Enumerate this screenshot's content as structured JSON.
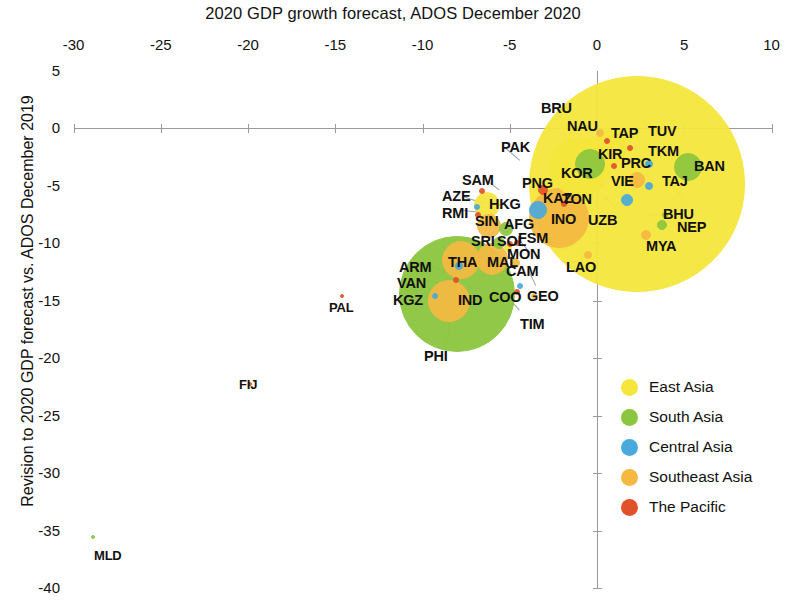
{
  "chart_data": {
    "type": "scatter",
    "title": "2020 GDP growth forecast, ADOS December 2020",
    "xlabel": "2020 GDP growth forecast, ADOS December 2020",
    "ylabel": "Revision to 2020 GDP forecast vs. ADOS December 2019",
    "xlim": [
      -32.5,
      11
    ],
    "ylim": [
      -41,
      6
    ],
    "xticks": [
      "-30",
      "-25",
      "-20",
      "-15",
      "-10",
      "-5",
      "0",
      "5",
      "10"
    ],
    "xtick_values": [
      -30,
      -25,
      -20,
      -15,
      -10,
      -5,
      0,
      5,
      10
    ],
    "yticks": [
      "5",
      "0",
      "-5",
      "-10",
      "-15",
      "-20",
      "-25",
      "-30",
      "-35",
      "-40"
    ],
    "ytick_values": [
      5,
      0,
      -5,
      -10,
      -15,
      -20,
      -25,
      -30,
      -35,
      -40
    ],
    "grid": false,
    "legend_position": "bottom-right",
    "legend": [
      {
        "label": "East Asia",
        "color": "#f5e63c"
      },
      {
        "label": "South Asia",
        "color": "#8cc63f"
      },
      {
        "label": "Central Asia",
        "color": "#4aa9dd"
      },
      {
        "label": "Southeast Asia",
        "color": "#f5b942"
      },
      {
        "label": "The Pacific",
        "color": "#e2522a"
      }
    ],
    "bubble_note": "bubble area scales with economy size",
    "points": [
      {
        "code": "PRC",
        "x": 2.3,
        "y": -4.9,
        "r": 108,
        "group": "East Asia"
      },
      {
        "code": "IND",
        "x": -8.0,
        "y": -14.4,
        "r": 58,
        "group": "South Asia"
      },
      {
        "code": "INO",
        "x": -2.2,
        "y": -7.8,
        "r": 30,
        "group": "Southeast Asia"
      },
      {
        "code": "KOR",
        "x": -1.0,
        "y": -3.4,
        "r": 30,
        "group": "East Asia"
      },
      {
        "code": "PAK",
        "x": -0.4,
        "y": -3.1,
        "r": 15,
        "group": "South Asia"
      },
      {
        "code": "PHI",
        "x": -8.5,
        "y": -15.0,
        "r": 21,
        "group": "Southeast Asia"
      },
      {
        "code": "BAN",
        "x": 5.2,
        "y": -3.4,
        "r": 14,
        "group": "South Asia"
      },
      {
        "code": "THA",
        "x": -7.8,
        "y": -11.5,
        "r": 19,
        "group": "Southeast Asia"
      },
      {
        "code": "MAL",
        "x": -6.0,
        "y": -11.4,
        "r": 16,
        "group": "Southeast Asia"
      },
      {
        "code": "HKG",
        "x": -6.3,
        "y": -6.7,
        "r": 13,
        "group": "East Asia"
      },
      {
        "code": "SIN",
        "x": -6.2,
        "y": -8.5,
        "r": 12,
        "group": "Southeast Asia"
      },
      {
        "code": "TAP",
        "x": 0.7,
        "y": -1.7,
        "r": 17,
        "group": "East Asia"
      },
      {
        "code": "VIE",
        "x": 2.3,
        "y": -4.5,
        "r": 8,
        "group": "Southeast Asia"
      },
      {
        "code": "KAZ",
        "x": -3.4,
        "y": -7.1,
        "r": 9,
        "group": "Central Asia"
      },
      {
        "code": "UZB",
        "x": 1.7,
        "y": -6.3,
        "r": 6,
        "group": "Central Asia"
      },
      {
        "code": "AFG",
        "x": -5.2,
        "y": -8.8,
        "r": 7,
        "group": "South Asia"
      },
      {
        "code": "SRI",
        "x": -5.6,
        "y": -10.0,
        "r": 6,
        "group": "South Asia"
      },
      {
        "code": "NEP",
        "x": 3.7,
        "y": -8.4,
        "r": 5,
        "group": "South Asia"
      },
      {
        "code": "MYA",
        "x": 2.8,
        "y": -9.3,
        "r": 5,
        "group": "Southeast Asia"
      },
      {
        "code": "CAM",
        "x": -4.7,
        "y": -11.7,
        "r": 5,
        "group": "Southeast Asia"
      },
      {
        "code": "MON",
        "x": -5.1,
        "y": -10.4,
        "r": 4,
        "group": "East Asia"
      },
      {
        "code": "LAO",
        "x": -0.5,
        "y": -11.0,
        "r": 4,
        "group": "Southeast Asia"
      },
      {
        "code": "PNG",
        "x": -3.1,
        "y": -5.4,
        "r": 5,
        "group": "The Pacific"
      },
      {
        "code": "KGZ",
        "x": -9.3,
        "y": -14.6,
        "r": 3,
        "group": "Central Asia"
      },
      {
        "code": "ARM",
        "x": -7.9,
        "y": -12.0,
        "r": 4,
        "group": "Central Asia"
      },
      {
        "code": "AZE",
        "x": -6.9,
        "y": -6.9,
        "r": 3,
        "group": "Central Asia"
      },
      {
        "code": "GEO",
        "x": -4.4,
        "y": -13.7,
        "r": 3,
        "group": "Central Asia"
      },
      {
        "code": "TAJ",
        "x": 3.0,
        "y": -5.0,
        "r": 4,
        "group": "Central Asia"
      },
      {
        "code": "TKM",
        "x": 3.0,
        "y": -3.1,
        "r": 4,
        "group": "Central Asia"
      },
      {
        "code": "BHU",
        "x": 3.9,
        "y": -7.6,
        "r": 3,
        "group": "South Asia"
      },
      {
        "code": "TIM",
        "x": -3.6,
        "y": -14.6,
        "r": 3,
        "group": "Southeast Asia"
      },
      {
        "code": "BRU",
        "x": 0.2,
        "y": -0.4,
        "r": 4,
        "group": "Southeast Asia"
      },
      {
        "code": "FSM",
        "x": -4.6,
        "y": -10.0,
        "r": 3,
        "group": "The Pacific"
      },
      {
        "code": "SOL",
        "x": -5.0,
        "y": -10.1,
        "r": 3,
        "group": "The Pacific"
      },
      {
        "code": "SAM",
        "x": -6.6,
        "y": -5.5,
        "r": 3,
        "group": "The Pacific"
      },
      {
        "code": "RMI",
        "x": -6.8,
        "y": -7.6,
        "r": 3,
        "group": "The Pacific"
      },
      {
        "code": "VAN",
        "x": -8.1,
        "y": -13.2,
        "r": 3,
        "group": "The Pacific"
      },
      {
        "code": "TON",
        "x": -1.9,
        "y": -6.6,
        "r": 3,
        "group": "The Pacific"
      },
      {
        "code": "NAU",
        "x": 0.6,
        "y": -1.1,
        "r": 3,
        "group": "The Pacific"
      },
      {
        "code": "TUV",
        "x": 1.9,
        "y": -1.7,
        "r": 3,
        "group": "The Pacific"
      },
      {
        "code": "KIR",
        "x": 1.0,
        "y": -3.3,
        "r": 3,
        "group": "The Pacific"
      },
      {
        "code": "COO",
        "x": -4.6,
        "y": -14.3,
        "r": 3,
        "group": "The Pacific"
      },
      {
        "code": "PAL",
        "x": -14.6,
        "y": -14.6,
        "r": 2,
        "group": "The Pacific"
      },
      {
        "code": "FIJ",
        "x": -19.9,
        "y": -22.3,
        "r": 2,
        "group": "The Pacific"
      },
      {
        "code": "MLD",
        "x": -28.9,
        "y": -35.6,
        "r": 2,
        "group": "South Asia"
      }
    ]
  },
  "labels": [
    {
      "code": "BRU",
      "lx": 541,
      "ly": 100
    },
    {
      "code": "NAU",
      "lx": 567,
      "ly": 118
    },
    {
      "code": "TAP",
      "lx": 611,
      "ly": 125
    },
    {
      "code": "TUV",
      "lx": 648,
      "ly": 123
    },
    {
      "code": "TKM",
      "lx": 648,
      "ly": 143
    },
    {
      "code": "KIR",
      "lx": 598,
      "ly": 146
    },
    {
      "code": "PRC",
      "lx": 621,
      "ly": 155
    },
    {
      "code": "BAN",
      "lx": 694,
      "ly": 158
    },
    {
      "code": "KOR",
      "lx": 561,
      "ly": 165
    },
    {
      "code": "VIE",
      "lx": 611,
      "ly": 173
    },
    {
      "code": "TAJ",
      "lx": 662,
      "ly": 173
    },
    {
      "code": "PAK",
      "lx": 501,
      "ly": 139
    },
    {
      "code": "SAM",
      "lx": 462,
      "ly": 172
    },
    {
      "code": "PNG",
      "lx": 522,
      "ly": 175
    },
    {
      "code": "AZE",
      "lx": 442,
      "ly": 188
    },
    {
      "code": "KAZ",
      "lx": 543,
      "ly": 190
    },
    {
      "code": "TON",
      "lx": 562,
      "ly": 191
    },
    {
      "code": "HKG",
      "lx": 489,
      "ly": 196
    },
    {
      "code": "RMI",
      "lx": 442,
      "ly": 205
    },
    {
      "code": "SIN",
      "lx": 475,
      "ly": 213
    },
    {
      "code": "AFG",
      "lx": 504,
      "ly": 216
    },
    {
      "code": "INO",
      "lx": 551,
      "ly": 211
    },
    {
      "code": "UZB",
      "lx": 588,
      "ly": 212
    },
    {
      "code": "BHU",
      "lx": 663,
      "ly": 206
    },
    {
      "code": "SRI",
      "lx": 471,
      "ly": 233
    },
    {
      "code": "SOL",
      "lx": 497,
      "ly": 233
    },
    {
      "code": "FSM",
      "lx": 518,
      "ly": 230
    },
    {
      "code": "NEP",
      "lx": 677,
      "ly": 219
    },
    {
      "code": "MYA",
      "lx": 646,
      "ly": 238
    },
    {
      "code": "MON",
      "lx": 507,
      "ly": 246
    },
    {
      "code": "ARM",
      "lx": 399,
      "ly": 259
    },
    {
      "code": "THA",
      "lx": 448,
      "ly": 254
    },
    {
      "code": "MAL",
      "lx": 487,
      "ly": 254
    },
    {
      "code": "CAM",
      "lx": 506,
      "ly": 263
    },
    {
      "code": "LAO",
      "lx": 566,
      "ly": 259
    },
    {
      "code": "VAN",
      "lx": 397,
      "ly": 275
    },
    {
      "code": "KGZ",
      "lx": 393,
      "ly": 292
    },
    {
      "code": "IND",
      "lx": 458,
      "ly": 292
    },
    {
      "code": "COO",
      "lx": 489,
      "ly": 289
    },
    {
      "code": "GEO",
      "lx": 527,
      "ly": 288
    },
    {
      "code": "PAL",
      "lx": 329,
      "ly": 300
    },
    {
      "code": "TIM",
      "lx": 520,
      "ly": 316
    },
    {
      "code": "PHI",
      "lx": 424,
      "ly": 348
    },
    {
      "code": "FIJ",
      "lx": 239,
      "ly": 377
    },
    {
      "code": "MLD",
      "lx": 94,
      "ly": 548
    }
  ],
  "leaders": [
    {
      "x1": 561,
      "y1": 106,
      "x2": 561,
      "y2": 118
    },
    {
      "x1": 505,
      "y1": 147,
      "x2": 520,
      "y2": 160
    },
    {
      "x1": 487,
      "y1": 180,
      "x2": 500,
      "y2": 190
    },
    {
      "x1": 463,
      "y1": 196,
      "x2": 484,
      "y2": 203
    },
    {
      "x1": 463,
      "y1": 210,
      "x2": 483,
      "y2": 212
    },
    {
      "x1": 605,
      "y1": 197,
      "x2": 616,
      "y2": 208
    },
    {
      "x1": 424,
      "y1": 263,
      "x2": 447,
      "y2": 272
    },
    {
      "x1": 424,
      "y1": 279,
      "x2": 440,
      "y2": 283
    },
    {
      "x1": 424,
      "y1": 296,
      "x2": 438,
      "y2": 297
    },
    {
      "x1": 520,
      "y1": 240,
      "x2": 530,
      "y2": 252
    },
    {
      "x1": 560,
      "y1": 249,
      "x2": 578,
      "y2": 243
    },
    {
      "x1": 529,
      "y1": 270,
      "x2": 536,
      "y2": 285
    },
    {
      "x1": 509,
      "y1": 298,
      "x2": 520,
      "y2": 310
    },
    {
      "x1": 445,
      "y1": 345,
      "x2": 455,
      "y2": 300
    },
    {
      "x1": 675,
      "y1": 188,
      "x2": 686,
      "y2": 202
    },
    {
      "x1": 648,
      "y1": 214,
      "x2": 672,
      "y2": 216
    },
    {
      "x1": 583,
      "y1": 253,
      "x2": 583,
      "y2": 262
    },
    {
      "x1": 583,
      "y1": 262,
      "x2": 562,
      "y2": 262
    }
  ]
}
